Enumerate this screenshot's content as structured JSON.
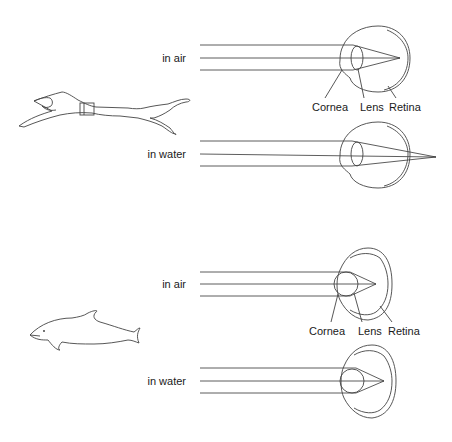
{
  "figure": {
    "panels": [
      {
        "subject": "human swimmer",
        "rows": [
          {
            "condition": "in air",
            "labels": [
              "Cornea",
              "Lens",
              "Retina"
            ]
          },
          {
            "condition": "in water"
          }
        ]
      },
      {
        "subject": "dolphin",
        "rows": [
          {
            "condition": "in air",
            "labels": [
              "Cornea",
              "Lens",
              "Retina"
            ]
          },
          {
            "condition": "in water"
          }
        ]
      }
    ]
  },
  "human": {
    "air_label": "in air",
    "water_label": "in water",
    "cornea_label": "Cornea",
    "lens_label": "Lens",
    "retina_label": "Retina"
  },
  "dolphin": {
    "air_label": "in air",
    "water_label": "in water",
    "cornea_label": "Cornea",
    "lens_label": "Lens",
    "retina_label": "Retina"
  },
  "colors": {
    "line": "#444444",
    "text": "#1a1a1a",
    "background": "#ffffff"
  }
}
